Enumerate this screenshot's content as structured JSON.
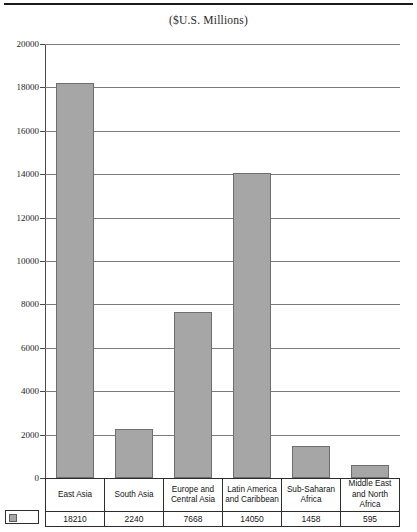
{
  "chart_data": {
    "type": "bar",
    "title": "($U.S. Millions)",
    "xlabel": "",
    "ylabel": "",
    "ylim": [
      0,
      20000
    ],
    "grid": true,
    "legend_position": "bottom-left-swatch",
    "categories": [
      "East Asia",
      "South Asia",
      "Europe and Central Asia",
      "Latin America and Caribbean",
      "Sub-Saharan Africa",
      "Middle East and North Africa"
    ],
    "category_lines": [
      [
        "East Asia"
      ],
      [
        "South Asia"
      ],
      [
        "Europe and",
        "Central Asia"
      ],
      [
        "Latin America",
        "and Caribbean"
      ],
      [
        "Sub-Saharan",
        "Africa"
      ],
      [
        "Middle East",
        "and North",
        "Africa"
      ]
    ],
    "values": [
      18210,
      2240,
      7668,
      14050,
      1458,
      595
    ],
    "value_labels": [
      "18210",
      "2240",
      "7668",
      "14050",
      "1458",
      "595"
    ],
    "ticks": [
      20000,
      18000,
      16000,
      14000,
      12000,
      10000,
      8000,
      6000,
      4000,
      2000,
      0
    ],
    "tick_labels": [
      "20000",
      "18000",
      "16000",
      "14000",
      "12000",
      "10000",
      "8000",
      "6000",
      "4000",
      "2000",
      "0"
    ],
    "series": [
      {
        "name": "series-1",
        "values": [
          18210,
          2240,
          7668,
          14050,
          1458,
          595
        ]
      }
    ],
    "colors": {
      "bar_fill": "#a6a6a6",
      "bar_border": "#6e6e6e",
      "gridline": "#7b7b7b",
      "axis": "#4a4a4a",
      "text": "#141414",
      "rule": "#1b1b1b"
    }
  }
}
